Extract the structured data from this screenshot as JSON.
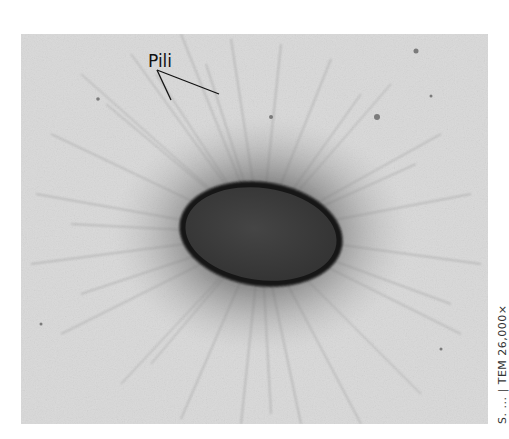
{
  "figure": {
    "annotation_label": "Pili",
    "credit": "S. ... | TEM 26,000×",
    "colors": {
      "background": "#ffffff",
      "field": "#dcdcdc",
      "cell_body": "#3a3a3a",
      "cell_wall": "#141414",
      "pili": "#6e6e6e",
      "annotation": "#111111"
    }
  }
}
